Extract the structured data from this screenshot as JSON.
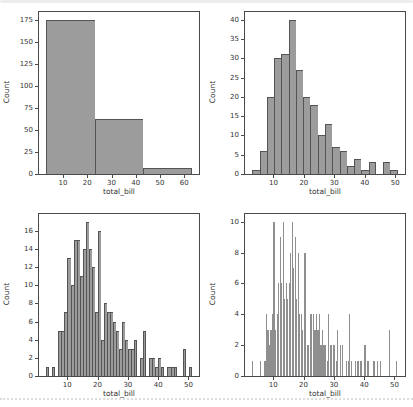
{
  "colors": {
    "bar_fill": "#9c9c9c",
    "bar_edge": "#545454",
    "thin_bar_fill": "#8f8f8f",
    "spine": "#4a4a4a",
    "text": "#333333",
    "top_strip": "#ededed",
    "bottom_divider": "#dcdcdc"
  },
  "chart_data": [
    {
      "type": "bar",
      "subtype": "histogram",
      "position": "top-left",
      "title": "",
      "xlabel": "total_bill",
      "ylabel": "Count",
      "bin_start": 3.07,
      "bin_width": 20,
      "counts": [
        175,
        62,
        7
      ],
      "xticks": [
        10,
        20,
        30,
        40,
        50,
        60
      ],
      "yticks": [
        0,
        25,
        50,
        75,
        100,
        125,
        150,
        175
      ],
      "xlim": [
        0.07,
        66.07
      ],
      "ylim": [
        0,
        183.75
      ],
      "grid": false,
      "legend": "none"
    },
    {
      "type": "bar",
      "subtype": "histogram",
      "position": "top-right",
      "title": "",
      "xlabel": "total_bill",
      "ylabel": "Count",
      "bin_start": 3.07,
      "bin_width": 2.387,
      "counts": [
        1,
        6,
        20,
        30,
        31,
        40,
        27,
        20,
        18,
        10,
        13,
        7,
        6,
        2,
        4,
        1,
        3,
        0,
        3,
        1
      ],
      "xticks": [
        10,
        20,
        30,
        40,
        50
      ],
      "yticks": [
        0,
        5,
        10,
        15,
        20,
        25,
        30,
        35,
        40
      ],
      "xlim": [
        0.68,
        53.2
      ],
      "ylim": [
        0,
        42
      ],
      "grid": false,
      "legend": "none"
    },
    {
      "type": "bar",
      "subtype": "histogram",
      "position": "bottom-left",
      "title": "",
      "xlabel": "total_bill",
      "ylabel": "Count",
      "bin_start": 3.07,
      "bin_width": 1,
      "counts": [
        1,
        0,
        1,
        0,
        5,
        5,
        7,
        13,
        10,
        15,
        15,
        11,
        14,
        17,
        14,
        12,
        7,
        16,
        4,
        8,
        7,
        7,
        6,
        5,
        3,
        6,
        4,
        3,
        3,
        4,
        0,
        2,
        5,
        0,
        2,
        2,
        1,
        2,
        1,
        0,
        1,
        1,
        1,
        0,
        0,
        3,
        0,
        1
      ],
      "xticks": [
        10,
        20,
        30,
        40,
        50
      ],
      "yticks": [
        0,
        2,
        4,
        6,
        8,
        10,
        12,
        14,
        16
      ],
      "xlim": [
        0.67,
        53.47
      ],
      "ylim": [
        0,
        17.85
      ],
      "grid": false,
      "legend": "none"
    },
    {
      "type": "bar",
      "subtype": "histogram",
      "position": "bottom-right",
      "title": "",
      "xlabel": "total_bill",
      "ylabel": "Count",
      "bin_start": 3.07,
      "bin_width": 0.5,
      "counts": [
        1,
        0,
        0,
        0,
        0,
        1,
        0,
        0,
        1,
        4,
        3,
        2,
        3,
        4,
        10,
        3,
        4,
        6,
        9,
        6,
        10,
        5,
        6,
        5,
        6,
        8,
        10,
        7,
        9,
        5,
        8,
        4,
        4,
        3,
        8,
        8,
        2,
        2,
        4,
        4,
        4,
        3,
        4,
        3,
        4,
        2,
        3,
        2,
        2,
        1,
        4,
        2,
        2,
        2,
        2,
        1,
        3,
        0,
        2,
        2,
        0,
        0,
        1,
        1,
        4,
        1,
        0,
        0,
        1,
        1,
        1,
        1,
        1,
        0,
        2,
        0,
        1,
        0,
        0,
        0,
        1,
        0,
        1,
        0,
        1,
        0,
        0,
        0,
        0,
        0,
        3,
        0,
        0,
        0,
        0,
        1
      ],
      "xticks": [
        10,
        20,
        30,
        40,
        50
      ],
      "yticks": [
        0,
        2,
        4,
        6,
        8,
        10
      ],
      "xlim": [
        0.67,
        53.47
      ],
      "ylim": [
        0,
        10.5
      ],
      "grid": false,
      "legend": "none"
    }
  ]
}
